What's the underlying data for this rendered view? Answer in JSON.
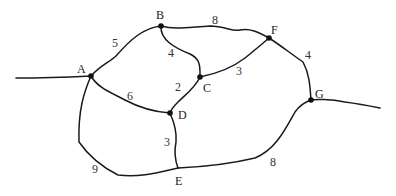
{
  "graph": {
    "type": "weighted-undirected-graph",
    "nodes": [
      {
        "id": "A",
        "label": "A",
        "x": 91,
        "y": 76,
        "label_x": 77,
        "label_y": 73
      },
      {
        "id": "B",
        "label": "B",
        "x": 161,
        "y": 26,
        "label_x": 156,
        "label_y": 19
      },
      {
        "id": "C",
        "label": "C",
        "x": 200,
        "y": 77,
        "label_x": 203,
        "label_y": 92
      },
      {
        "id": "D",
        "label": "D",
        "x": 170,
        "y": 113,
        "label_x": 178,
        "label_y": 119
      },
      {
        "id": "E",
        "label": "E",
        "x": 178,
        "y": 168,
        "label_x": 176,
        "label_y": 185
      },
      {
        "id": "F",
        "label": "F",
        "x": 269,
        "y": 38,
        "label_x": 271,
        "label_y": 34
      },
      {
        "id": "G",
        "label": "G",
        "x": 311,
        "y": 100,
        "label_x": 315,
        "label_y": 98
      }
    ],
    "edges": [
      {
        "from": "A",
        "to": "B",
        "weight": "5",
        "weight_x": 112,
        "weight_y": 47
      },
      {
        "from": "B",
        "to": "F",
        "weight": "8",
        "weight_x": 212,
        "weight_y": 24
      },
      {
        "from": "B",
        "to": "C",
        "weight": "4",
        "weight_x": 168,
        "weight_y": 57
      },
      {
        "from": "C",
        "to": "F",
        "weight": "3",
        "weight_x": 236,
        "weight_y": 75
      },
      {
        "from": "C",
        "to": "D",
        "weight": "2",
        "weight_x": 175,
        "weight_y": 91
      },
      {
        "from": "A",
        "to": "D",
        "weight": "6",
        "weight_x": 127,
        "weight_y": 100
      },
      {
        "from": "F",
        "to": "G",
        "weight": "4",
        "weight_x": 305,
        "weight_y": 59
      },
      {
        "from": "D",
        "to": "E",
        "weight": "3",
        "weight_x": 165,
        "weight_y": 146
      },
      {
        "from": "A",
        "to": "E",
        "weight": "9",
        "weight_x": 92,
        "weight_y": 173
      },
      {
        "from": "E",
        "to": "G",
        "weight": "8",
        "weight_x": 270,
        "weight_y": 166
      }
    ],
    "dangling_edges": [
      {
        "from_point": "left-boundary",
        "to": "A"
      },
      {
        "from": "G",
        "to_point": "right-boundary"
      }
    ]
  }
}
